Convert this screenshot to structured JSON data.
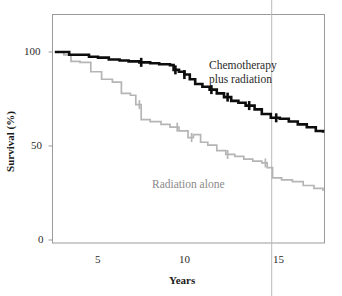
{
  "chart_data": {
    "type": "line",
    "subtype": "kaplan-meier-survival-step",
    "title": "",
    "xlabel": "Years",
    "ylabel": "Survival (%)",
    "xlim": [
      0,
      17.6
    ],
    "ylim": [
      0,
      105
    ],
    "xticks": [
      5,
      10,
      15
    ],
    "xtick_labels": [
      "5",
      "10",
      "15"
    ],
    "yticks": [
      0,
      50,
      100
    ],
    "ytick_labels": [
      "0",
      "50",
      "100"
    ],
    "grid": false,
    "legend_position": "inline-annotation",
    "frame": "box",
    "series": [
      {
        "name": "Chemotherapy plus radiation",
        "color": "#0d0d0d",
        "line_width": 2.6,
        "annotation": "Chemotherapy\nplus radiation",
        "x": [
          2.6,
          3.0,
          3.4,
          4.0,
          4.5,
          5.0,
          5.6,
          6.2,
          6.7,
          7.3,
          7.9,
          8.4,
          9.0,
          9.2,
          9.5,
          9.8,
          10.1,
          10.4,
          10.8,
          11.2,
          11.6,
          12.0,
          12.4,
          12.8,
          13.2,
          13.7,
          14.1,
          14.6,
          15.1,
          15.6,
          16.1,
          16.6,
          17.1,
          17.5
        ],
        "y": [
          100,
          100,
          98.5,
          98.5,
          97.5,
          97.0,
          96.0,
          95.5,
          95.0,
          94.5,
          94.0,
          93.5,
          93.0,
          90.5,
          89.5,
          88.0,
          85.5,
          83.0,
          81.5,
          80.0,
          78.0,
          76.0,
          74.0,
          73.0,
          71.5,
          69.5,
          67.0,
          65.0,
          64.5,
          63.0,
          61.5,
          60.0,
          58.0,
          57.0
        ],
        "censor_marks_x": [
          7.4,
          9.3,
          9.8,
          11.3,
          12.2,
          13.4,
          14.9
        ],
        "start_value": 100,
        "end_value": 57
      },
      {
        "name": "Radiation alone",
        "color": "#b5b5b5",
        "line_width": 1.7,
        "annotation": "Radiation alone",
        "x": [
          2.6,
          3.1,
          3.5,
          4.0,
          4.6,
          5.2,
          5.8,
          6.3,
          6.8,
          7.1,
          7.4,
          7.9,
          8.5,
          9.0,
          9.5,
          10.0,
          10.3,
          10.7,
          11.1,
          11.6,
          12.1,
          12.6,
          13.1,
          13.6,
          14.1,
          14.4,
          14.7,
          15.2,
          15.8,
          16.4,
          17.0,
          17.5
        ],
        "y": [
          100,
          98.5,
          95.0,
          94.5,
          89.5,
          85.5,
          84.0,
          78.0,
          77.0,
          72.0,
          64.0,
          63.0,
          61.5,
          60.0,
          58.0,
          54.5,
          56.0,
          52.0,
          50.5,
          47.5,
          45.5,
          44.5,
          43.0,
          42.0,
          41.0,
          38.5,
          33.0,
          32.0,
          31.0,
          29.0,
          27.5,
          26.0
        ],
        "censor_marks_x": [
          7.3,
          9.4,
          10.2,
          12.2,
          14.3
        ],
        "start_value": 100,
        "end_value": 26
      }
    ],
    "artifacts": {
      "scan_line_x": 14.65,
      "scan_line_color": "#b9b9b9"
    }
  },
  "axes": {
    "y_tick_100": "100",
    "y_tick_50": "50",
    "y_tick_0": "0",
    "x_tick_5": "5",
    "x_tick_10": "10",
    "x_tick_15": "15",
    "x_axis_title": "Years",
    "y_axis_title": "Survival (%)"
  },
  "annotations": {
    "chemo_line1": "Chemotherapy",
    "chemo_line2": "plus radiation",
    "radiation": "Radiation alone"
  },
  "colors": {
    "chemo": "#0d0d0d",
    "radiation": "#b5b5b5",
    "frame": "#9a9a9a",
    "text": "#1a1a1a"
  }
}
